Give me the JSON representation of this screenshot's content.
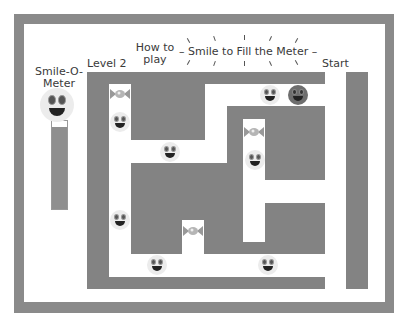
{
  "game": {
    "title": "Smile to Fill the Meter",
    "title_decoration": "–",
    "level_label": "Level 2",
    "help_label_line1": "How to",
    "help_label_line2": "play",
    "start_label": "Start",
    "meter": {
      "label_line1": "Smile-O-",
      "label_line2": "Meter",
      "fill_percent": 93
    }
  },
  "colors": {
    "wall": "#838383",
    "frame": "#8a8a8a",
    "path": "#ffffff",
    "player": "#6e6e6e",
    "smiley": "#ececec"
  },
  "pieces": {
    "smileys": [
      {
        "x": 110,
        "y": 112
      },
      {
        "x": 160,
        "y": 142
      },
      {
        "x": 260,
        "y": 85
      },
      {
        "x": 245,
        "y": 150
      },
      {
        "x": 110,
        "y": 210
      },
      {
        "x": 147,
        "y": 255
      },
      {
        "x": 258,
        "y": 255
      }
    ],
    "candies": [
      {
        "x": 110,
        "y": 88
      },
      {
        "x": 244,
        "y": 126
      },
      {
        "x": 183,
        "y": 225
      }
    ],
    "player": {
      "x": 288,
      "y": 85
    }
  }
}
